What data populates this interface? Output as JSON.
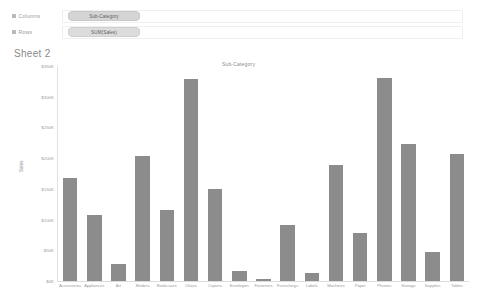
{
  "shelves": {
    "columns": {
      "label": "Columns",
      "icon": "grid-icon",
      "pill": "Sub-Category"
    },
    "rows": {
      "label": "Rows",
      "icon": "grid-icon",
      "pill": "SUM(Sales)"
    }
  },
  "sheet": {
    "title": "Sheet 2"
  },
  "chart_data": {
    "type": "bar",
    "title": "Sub-Category",
    "xlabel": "",
    "ylabel": "Sales",
    "ylim": [
      0,
      350000
    ],
    "grid": false,
    "legend": "none",
    "ytick_labels": [
      "$350K",
      "$300K",
      "$250K",
      "$200K",
      "$150K",
      "$100K",
      "$50K",
      "$0K"
    ],
    "ytick_values": [
      350000,
      300000,
      250000,
      200000,
      150000,
      100000,
      50000,
      0
    ],
    "bar_color": "#8c8c8c",
    "categories": [
      "Accessories",
      "Appliances",
      "Art",
      "Binders",
      "Bookcases",
      "Chairs",
      "Copiers",
      "Envelopes",
      "Fasteners",
      "Furnishings",
      "Labels",
      "Machines",
      "Paper",
      "Phones",
      "Storage",
      "Supplies",
      "Tables"
    ],
    "values": [
      167380,
      107530,
      27119,
      203413,
      114880,
      328449,
      149528,
      16476,
      3024,
      91705,
      12486,
      189239,
      78479,
      330007,
      223844,
      46674,
      206966
    ]
  }
}
